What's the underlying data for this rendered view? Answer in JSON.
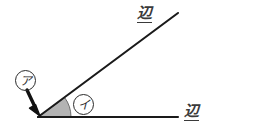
{
  "figure": {
    "width": 266,
    "height": 130,
    "background_color": "#ffffff",
    "line_color": "#1a1a1a",
    "sector_fill_color": "#b3b3b3",
    "sector_stroke_color": "#6e6e6e",
    "arrow_color": "#111111",
    "label_color": "#2b2b2b"
  },
  "geometry": {
    "vertex": {
      "x": 38,
      "y": 117
    },
    "bottom_ray_end": {
      "x": 178,
      "y": 117
    },
    "top_ray_end": {
      "x": 178,
      "y": 13
    },
    "angle_degrees": 36,
    "sector_radius": 33
  },
  "labels": {
    "side_top": "辺",
    "side_bottom": "辺",
    "marker_vertex": "ア",
    "marker_angle": "イ"
  },
  "annotations": {
    "arrow_from": {
      "x": 28,
      "y": 90
    },
    "arrow_to": {
      "x": 39,
      "y": 114
    },
    "arrow_label_ref": "marker_vertex",
    "angle_label_ref": "marker_angle"
  },
  "chart_data": {
    "type": "diagram",
    "subtype": "geometric-angle",
    "elements": [
      {
        "name": "vertex",
        "label": "ア",
        "x": 38,
        "y": 117
      },
      {
        "name": "side-horizontal",
        "label": "辺",
        "from": [
          38,
          117
        ],
        "to": [
          178,
          117
        ]
      },
      {
        "name": "side-diagonal",
        "label": "辺",
        "from": [
          38,
          117
        ],
        "to": [
          178,
          13
        ]
      },
      {
        "name": "angle-sector",
        "label": "イ",
        "degrees": 36,
        "radius": 33
      }
    ]
  }
}
